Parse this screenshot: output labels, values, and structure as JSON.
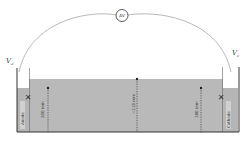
{
  "diagram": {
    "meter": {
      "label": "ΔV"
    },
    "voltages": {
      "left": "V",
      "left_sub": "a",
      "right": "V",
      "right_sub": "c"
    },
    "electrodes": {
      "left": "Anode",
      "right": "Cathode"
    },
    "depths": [
      {
        "position": "left",
        "label": "200 mm"
      },
      {
        "position": "center",
        "label": "~110 mm"
      },
      {
        "position": "right",
        "label": "180 mm"
      }
    ],
    "colors": {
      "liquid": "#b9b9b9",
      "wall": "#333333",
      "wire": "#9a9a9a"
    }
  }
}
